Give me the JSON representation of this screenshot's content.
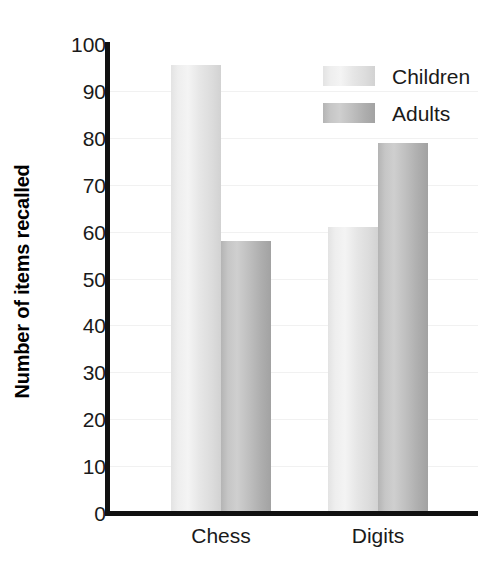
{
  "chart_data": {
    "type": "bar",
    "title": "",
    "subtitle": "",
    "xlabel": "",
    "ylabel": "Number of items recalled",
    "categories": [
      "Chess",
      "Digits"
    ],
    "series": [
      {
        "name": "Children",
        "values": [
          95.5,
          61
        ],
        "color": "#e9e9e9"
      },
      {
        "name": "Adults",
        "values": [
          58,
          79
        ],
        "color": "#bdbdbd"
      }
    ],
    "ylim": [
      0,
      100
    ],
    "ytick_step": 10,
    "yticks": [
      0,
      10,
      20,
      30,
      40,
      50,
      60,
      70,
      80,
      90,
      100
    ],
    "ytick_labels": [
      "0",
      "10",
      "20",
      "30",
      "40",
      "50",
      "60",
      "70",
      "80",
      "90",
      "100"
    ],
    "grid": true,
    "grid_axis": "y",
    "grid_color": "#f1f1f1",
    "legend_position": "top-right-inside",
    "legend_entries": [
      "Children",
      "Adults"
    ],
    "axis_color": "#111111",
    "background_color": "#ffffff",
    "bar_group_gap": true,
    "bars_touch_within_group": true
  }
}
